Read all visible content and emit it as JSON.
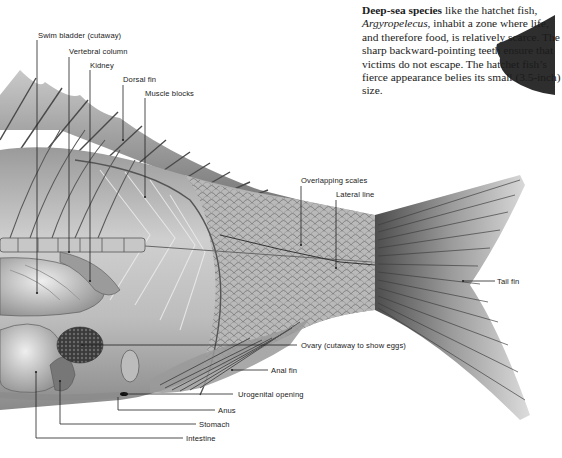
{
  "caption": {
    "lead_bold": "Deep-sea species",
    "text_1": " like the hatchet fish, ",
    "species_italic": "Argyropelecus",
    "text_2": ", inhabit a zone where life, and therefore food, is relatively scarce. The sharp backward-pointing teeth ensure that victims do not escape. The hatchet fish’s fierce appearance belies its small (3.5-inch) size."
  },
  "labels": {
    "swim_bladder": "Swim bladder (cutaway)",
    "vertebral_column": "Vertebral column",
    "kidney": "Kidney",
    "dorsal_fin": "Dorsal fin",
    "muscle_blocks": "Muscle blocks",
    "overlapping_scales": "Overlapping scales",
    "lateral_line": "Lateral line",
    "tail_fin": "Tail fin",
    "ovary": "Ovary (cutaway to show eggs)",
    "anal_fin": "Anal fin",
    "urogenital_opening": "Urogenital opening",
    "anus": "Anus",
    "stomach": "Stomach",
    "intestine": "Intestine"
  },
  "colors": {
    "ink": "#222222",
    "body_light": "#d8d8d8",
    "body_mid": "#a9a9a9",
    "body_dark": "#5c5c5c",
    "hatchet_fish": "#2e2e2e"
  }
}
